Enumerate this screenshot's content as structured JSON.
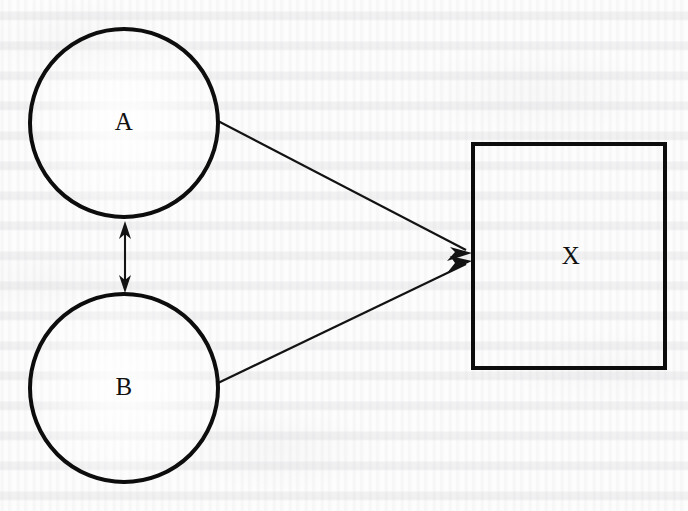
{
  "figure": {
    "type": "node-link-diagram",
    "background_color": "#fdfdfd",
    "ink_color": "#0d0d0d",
    "medium": "scanned book page with faint reverse-side bleed-through text"
  },
  "nodes": [
    {
      "id": "A",
      "label": "A",
      "shape": "circle",
      "cx": 124,
      "cy": 123,
      "r": 94,
      "stroke_width": 4
    },
    {
      "id": "B",
      "label": "B",
      "shape": "circle",
      "cx": 124,
      "cy": 388,
      "r": 94,
      "stroke_width": 4
    },
    {
      "id": "X",
      "label": "X",
      "shape": "rectangle",
      "x": 473,
      "y": 144,
      "width": 192,
      "height": 224,
      "stroke_width": 4
    }
  ],
  "edges": [
    {
      "id": "A-to-X",
      "from": "A",
      "to": "X",
      "direction": "one-way",
      "x1": 218,
      "y1": 121,
      "x2": 470,
      "y2": 252
    },
    {
      "id": "B-to-X",
      "from": "B",
      "to": "X",
      "direction": "one-way",
      "x1": 218,
      "y1": 383,
      "x2": 470,
      "y2": 262
    },
    {
      "id": "A-B-bidirectional",
      "from": "A",
      "to": "B",
      "direction": "two-way",
      "x1": 125,
      "y1": 223,
      "x2": 125,
      "y2": 291
    }
  ]
}
